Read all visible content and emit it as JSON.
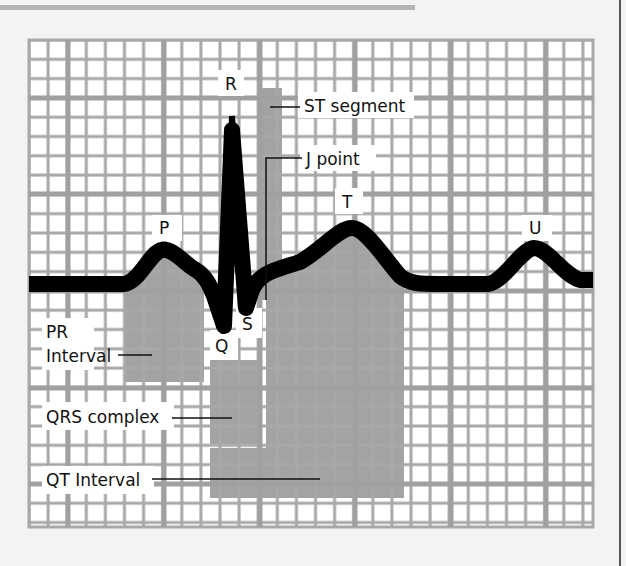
{
  "figure": {
    "wave_labels": {
      "P": "P",
      "Q": "Q",
      "R": "R",
      "S": "S",
      "T": "T",
      "U": "U"
    },
    "annotations": {
      "st_segment": "ST segment",
      "j_point": "J point",
      "pr_interval_line1": "PR",
      "pr_interval_line2": "Interval",
      "qrs_complex": "QRS complex",
      "qt_interval": "QT Interval"
    },
    "colors": {
      "background": "#f3f3f3",
      "grid_paper": "#ffffff",
      "grid_line": "#a8a8a8",
      "shade": "#9a9a9a",
      "trace": "#000000"
    }
  }
}
